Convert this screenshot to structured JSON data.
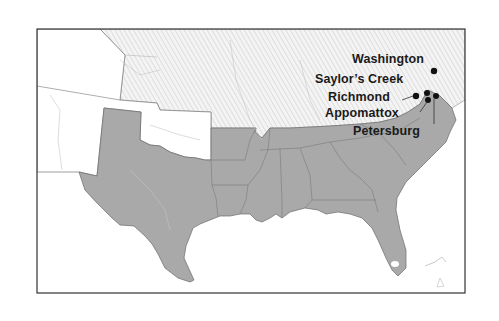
{
  "map": {
    "region": "Eastern & Southern United States",
    "colors": {
      "confederacy": "#a9a9a9",
      "union_hatch": "#e6e6e6",
      "territories": "#ffffff",
      "water": "#ffffff",
      "border": "#555555",
      "frame": "#333333",
      "marker": "#111111"
    },
    "legend_regions": [
      "confederate-states",
      "union-states",
      "western-territories"
    ],
    "locations": [
      {
        "name": "Washington",
        "label": "Washington"
      },
      {
        "name": "Saylors Creek",
        "label": "Saylor’s Creek"
      },
      {
        "name": "Richmond",
        "label": "Richmond"
      },
      {
        "name": "Appomattox",
        "label": "Appomattox"
      },
      {
        "name": "Petersburg",
        "label": "Petersburg"
      }
    ]
  }
}
